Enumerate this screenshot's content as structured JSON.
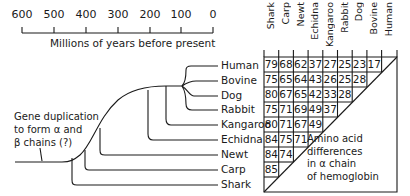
{
  "timescale": {
    "ticks": [
      "600",
      "500",
      "400",
      "300",
      "200",
      "100",
      "0"
    ],
    "title": "Millions of years before present"
  },
  "gene_note": {
    "line1": "Gene duplication",
    "line2": "to form α and",
    "line3": "β chains (?)"
  },
  "species": [
    "Human",
    "Bovine",
    "Dog",
    "Rabbit",
    "Kangaroo",
    "Echidna",
    "Newt",
    "Carp",
    "Shark"
  ],
  "table": {
    "columns": [
      "Shark",
      "Carp",
      "Newt",
      "Echidna",
      "Kangaroo",
      "Rabbit",
      "Dog",
      "Bovine",
      "Human"
    ],
    "rows": [
      {
        "species": "Human",
        "values": [
          "79",
          "68",
          "62",
          "37",
          "27",
          "25",
          "23",
          "17"
        ]
      },
      {
        "species": "Bovine",
        "values": [
          "75",
          "65",
          "64",
          "43",
          "26",
          "25",
          "28"
        ]
      },
      {
        "species": "Dog",
        "values": [
          "80",
          "67",
          "65",
          "42",
          "33",
          "28"
        ]
      },
      {
        "species": "Rabbit",
        "values": [
          "75",
          "71",
          "69",
          "49",
          "37"
        ]
      },
      {
        "species": "Kangaroo",
        "values": [
          "80",
          "71",
          "67",
          "49"
        ]
      },
      {
        "species": "Echidna",
        "values": [
          "84",
          "75",
          "71"
        ]
      },
      {
        "species": "Newt",
        "values": [
          "84",
          "74"
        ]
      },
      {
        "species": "Carp",
        "values": [
          "85"
        ]
      },
      {
        "species": "Shark",
        "values": []
      }
    ],
    "note": {
      "line1": "Amino acid",
      "line2": "differences",
      "line3": "in α chain",
      "line4": "of hemoglobin"
    }
  }
}
